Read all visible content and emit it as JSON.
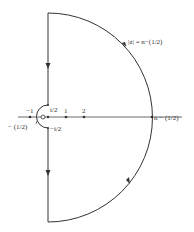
{
  "diagram": {
    "type": "contour",
    "colors": {
      "stroke": "#333333",
      "background": "#ffffff"
    },
    "labels": {
      "arc": "|z| = n−(1/2)",
      "right_point": "n − (1/2)",
      "top_small": "i/2",
      "bottom_small": "−i/2",
      "minus_one": "−1",
      "minus_half": "− (1/2)",
      "origin": "O",
      "one": "1",
      "two": "2"
    },
    "arrows": [
      {
        "segment": "upper-vertical",
        "direction": "down"
      },
      {
        "segment": "lower-vertical",
        "direction": "down"
      },
      {
        "segment": "upper-arc",
        "direction": "counterclockwise"
      },
      {
        "segment": "lower-arc",
        "direction": "counterclockwise"
      }
    ]
  }
}
